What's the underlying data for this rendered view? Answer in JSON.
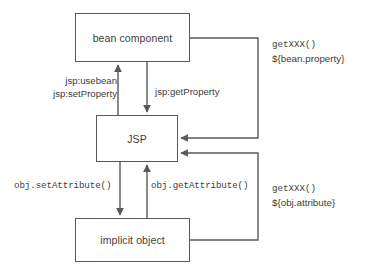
{
  "diagram": {
    "colors": {
      "stroke": "#595959",
      "text": "#3d3d3d",
      "background": "#ffffff"
    },
    "nodes": [
      {
        "id": "bean",
        "label": "bean component"
      },
      {
        "id": "jsp",
        "label": "JSP"
      },
      {
        "id": "implicit",
        "label": "implicit object"
      }
    ],
    "edge_labels": {
      "usebean": "jsp:usebean",
      "setproperty": "jsp:setProperty",
      "getproperty": "jsp:getProperty",
      "setattribute": "obj.setAttribute()",
      "getattribute": "obj.getAttribute()"
    },
    "expression_labels": [
      {
        "id": "bean-el",
        "method": "getXXX()",
        "expression": "${bean.property}"
      },
      {
        "id": "obj-el",
        "method": "getXXX()",
        "expression": "${obj.attribute}"
      }
    ]
  }
}
